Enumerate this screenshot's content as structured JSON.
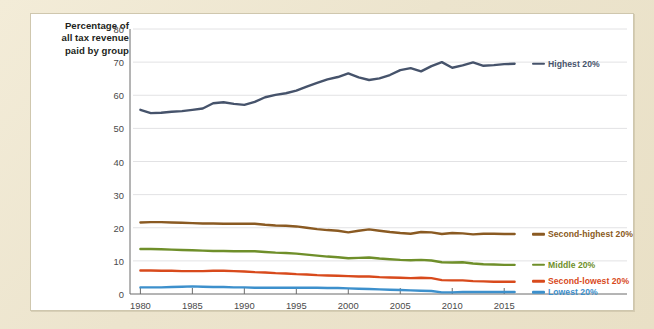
{
  "figure": {
    "background_color": "#efe8d3",
    "panel_color": "#ffffff",
    "panel_border_color": "#cfc7ae"
  },
  "chart_data": {
    "type": "line",
    "title": "",
    "ylabel": "Percentage of all tax revenue paid by group",
    "ylabel_lines": [
      "Percentage of",
      "all tax revenue",
      "paid by group"
    ],
    "xlabel": "",
    "xlim": [
      1979,
      2017
    ],
    "ylim": [
      0,
      80
    ],
    "yticks": [
      0,
      10,
      20,
      30,
      40,
      50,
      60,
      70,
      80
    ],
    "ytick_labels": [
      "0",
      "10",
      "20",
      "30",
      "40",
      "50",
      "60",
      "70",
      "80"
    ],
    "xticks": [
      1980,
      1985,
      1990,
      1995,
      2000,
      2005,
      2010,
      2015
    ],
    "xtick_labels": [
      "1980",
      "1985",
      "1990",
      "1995",
      "2000",
      "2005",
      "2010",
      "2015"
    ],
    "grid": "horizontal",
    "grid_color": "#e2e2e4",
    "legend_position": "right-inline",
    "x": [
      1980,
      1981,
      1982,
      1983,
      1984,
      1985,
      1986,
      1987,
      1988,
      1989,
      1990,
      1991,
      1992,
      1993,
      1994,
      1995,
      1996,
      1997,
      1998,
      1999,
      2000,
      2001,
      2002,
      2003,
      2004,
      2005,
      2006,
      2007,
      2008,
      2009,
      2010,
      2011,
      2012,
      2013,
      2014,
      2015,
      2016
    ],
    "series": [
      {
        "name": "Highest 20%",
        "color": "#46536b",
        "label_color": "#46536b",
        "values": [
          55.6,
          54.6,
          54.7,
          55.0,
          55.2,
          55.6,
          56.0,
          57.6,
          57.9,
          57.4,
          57.1,
          58.0,
          59.4,
          60.1,
          60.6,
          61.4,
          62.6,
          63.7,
          64.8,
          65.5,
          66.6,
          65.4,
          64.6,
          65.1,
          66.1,
          67.6,
          68.2,
          67.2,
          68.8,
          70.0,
          68.3,
          69.0,
          69.9,
          68.9,
          69.1,
          69.4,
          69.5
        ]
      },
      {
        "name": "Second-highest 20%",
        "color": "#8a5a22",
        "label_color": "#8a5a22",
        "values": [
          21.6,
          21.7,
          21.7,
          21.6,
          21.5,
          21.4,
          21.3,
          21.3,
          21.2,
          21.2,
          21.2,
          21.2,
          20.9,
          20.7,
          20.6,
          20.4,
          20.0,
          19.6,
          19.3,
          19.1,
          18.6,
          19.1,
          19.5,
          19.1,
          18.7,
          18.4,
          18.2,
          18.7,
          18.6,
          18.1,
          18.4,
          18.3,
          18.0,
          18.2,
          18.2,
          18.1,
          18.1
        ]
      },
      {
        "name": "Middle 20%",
        "color": "#6f8f2a",
        "label_color": "#6f8f2a",
        "values": [
          13.6,
          13.6,
          13.5,
          13.4,
          13.3,
          13.2,
          13.1,
          13.0,
          13.0,
          12.9,
          12.9,
          12.9,
          12.7,
          12.5,
          12.4,
          12.2,
          11.9,
          11.6,
          11.3,
          11.1,
          10.8,
          10.9,
          11.0,
          10.7,
          10.5,
          10.3,
          10.2,
          10.3,
          10.1,
          9.6,
          9.5,
          9.6,
          9.2,
          9.0,
          8.9,
          8.8,
          8.8
        ]
      },
      {
        "name": "Second-lowest 20%",
        "color": "#d84a1c",
        "label_color": "#d84a1c",
        "values": [
          7.1,
          7.1,
          7.0,
          7.0,
          6.9,
          6.9,
          6.9,
          7.0,
          7.0,
          6.9,
          6.8,
          6.6,
          6.5,
          6.3,
          6.2,
          6.0,
          5.9,
          5.7,
          5.6,
          5.5,
          5.4,
          5.3,
          5.3,
          5.1,
          5.0,
          4.9,
          4.8,
          4.9,
          4.8,
          4.2,
          4.1,
          4.1,
          3.9,
          3.8,
          3.7,
          3.7,
          3.7
        ]
      },
      {
        "name": "Lowest 20%",
        "color": "#3d90cc",
        "label_color": "#3d90cc",
        "values": [
          2.0,
          2.0,
          2.0,
          2.1,
          2.2,
          2.3,
          2.2,
          2.1,
          2.1,
          2.0,
          2.0,
          1.9,
          1.9,
          1.9,
          1.9,
          1.9,
          1.9,
          1.9,
          1.8,
          1.8,
          1.7,
          1.6,
          1.5,
          1.4,
          1.3,
          1.2,
          1.1,
          1.0,
          0.9,
          0.5,
          0.5,
          0.6,
          0.6,
          0.6,
          0.6,
          0.6,
          0.6
        ]
      }
    ]
  }
}
